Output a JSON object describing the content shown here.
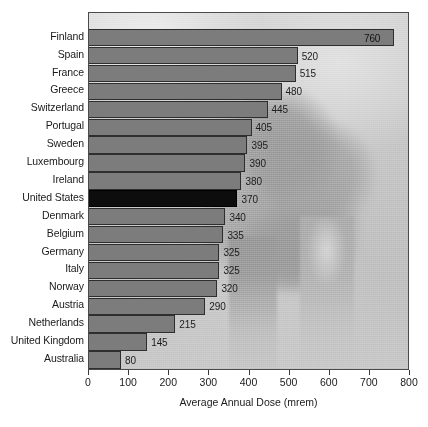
{
  "chart_data": {
    "type": "bar",
    "orientation": "horizontal",
    "title": "",
    "xlabel": "Average Annual Dose (mrem)",
    "ylabel": "",
    "xlim": [
      0,
      800
    ],
    "xticks": [
      0,
      100,
      200,
      300,
      400,
      500,
      600,
      700,
      800
    ],
    "grid": false,
    "legend": null,
    "categories": [
      "Finland",
      "Spain",
      "France",
      "Greece",
      "Switzerland",
      "Portugal",
      "Sweden",
      "Luxembourg",
      "Ireland",
      "United States",
      "Denmark",
      "Belgium",
      "Germany",
      "Italy",
      "Norway",
      "Austria",
      "Netherlands",
      "United Kingdom",
      "Australia"
    ],
    "values": [
      760,
      520,
      515,
      480,
      445,
      405,
      395,
      390,
      380,
      370,
      340,
      335,
      325,
      325,
      320,
      290,
      215,
      145,
      80
    ],
    "value_labels": [
      "760",
      "520",
      "515",
      "480",
      "445",
      "405",
      "395",
      "390",
      "380",
      "370",
      "340",
      "335",
      "325",
      "325",
      "320",
      "290",
      "215",
      "145",
      "80"
    ],
    "highlighted_category": "United States",
    "colors": {
      "bar_fill": "#7c7c7c",
      "bar_border": "#2e2e2e",
      "highlight_fill": "#0d0d0d",
      "plot_border": "#4a4a4a",
      "text": "#1a1a1a",
      "background_photo": "#c3c3c3"
    },
    "background_image": "cooling-towers-photo"
  },
  "axis": {
    "x_title": "Average Annual Dose (mrem)",
    "tick_labels": [
      "0",
      "100",
      "200",
      "300",
      "400",
      "500",
      "600",
      "700",
      "800"
    ]
  }
}
